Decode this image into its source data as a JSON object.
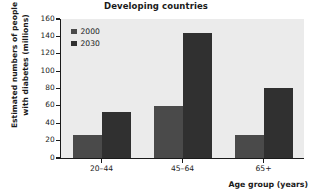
{
  "chart_data": {
    "type": "bar",
    "title": "Developing countries",
    "xlabel": "Age group (years)",
    "ylabel": "Estimated numbers of people\nwith diabetes (millions)",
    "categories": [
      "20–44",
      "45–64",
      "65+"
    ],
    "series": [
      {
        "name": "2000",
        "values": [
          27,
          60,
          26
        ],
        "color": "#4a4a4a"
      },
      {
        "name": "2030",
        "values": [
          53,
          144,
          81
        ],
        "color": "#303030"
      }
    ],
    "ylim": [
      0,
      160
    ],
    "yticks": [
      0,
      20,
      40,
      60,
      80,
      100,
      120,
      140,
      160
    ],
    "ytick_labels": [
      "0",
      "20",
      "40",
      "60",
      "80",
      "100",
      "120",
      "140",
      "160"
    ],
    "grid": false,
    "legend_position": "top-left-inside",
    "plot_background": "#ebebeb",
    "axis_color": "#1a1a1a"
  },
  "legend": {
    "entries": [
      {
        "label": "2000"
      },
      {
        "label": "2030"
      }
    ]
  }
}
